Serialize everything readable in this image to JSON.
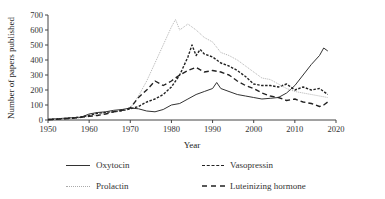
{
  "chart_data": {
    "type": "line",
    "title": "",
    "xlabel": "Year",
    "ylabel": "Number of papers published",
    "xlim": [
      1950,
      2020
    ],
    "ylim": [
      0,
      700
    ],
    "x_ticks": [
      1950,
      1960,
      1970,
      1980,
      1990,
      2000,
      2010,
      2020
    ],
    "y_ticks": [
      0,
      100,
      200,
      300,
      400,
      500,
      600,
      700
    ],
    "grid": false,
    "legend_position": "bottom",
    "series": [
      {
        "name": "Oxytocin",
        "style": "solid",
        "color": "#333333",
        "x": [
          1950,
          1952,
          1954,
          1956,
          1958,
          1960,
          1962,
          1964,
          1966,
          1968,
          1970,
          1972,
          1974,
          1976,
          1978,
          1980,
          1982,
          1984,
          1986,
          1988,
          1990,
          1991,
          1992,
          1994,
          1996,
          1998,
          2000,
          2002,
          2004,
          2006,
          2008,
          2010,
          2012,
          2014,
          2016,
          2017,
          2018
        ],
        "values": [
          5,
          8,
          12,
          15,
          18,
          40,
          50,
          55,
          65,
          70,
          80,
          75,
          60,
          55,
          70,
          100,
          110,
          140,
          170,
          190,
          210,
          250,
          210,
          190,
          170,
          160,
          150,
          140,
          145,
          150,
          180,
          230,
          300,
          370,
          430,
          480,
          460
        ]
      },
      {
        "name": "Vasopressin",
        "style": "dashed-fine",
        "color": "#222222",
        "x": [
          1950,
          1952,
          1954,
          1956,
          1958,
          1960,
          1962,
          1964,
          1966,
          1968,
          1970,
          1972,
          1974,
          1976,
          1978,
          1980,
          1982,
          1984,
          1985,
          1986,
          1987,
          1988,
          1990,
          1992,
          1994,
          1996,
          1998,
          2000,
          2002,
          2004,
          2006,
          2008,
          2010,
          2012,
          2014,
          2016,
          2018
        ],
        "values": [
          3,
          6,
          10,
          14,
          20,
          30,
          45,
          50,
          55,
          62,
          75,
          90,
          120,
          140,
          170,
          220,
          300,
          420,
          500,
          430,
          470,
          440,
          420,
          380,
          360,
          330,
          290,
          240,
          230,
          230,
          220,
          240,
          200,
          220,
          200,
          210,
          170
        ]
      },
      {
        "name": "Prolactin",
        "style": "dotted",
        "color": "#aaaaaa",
        "x": [
          1950,
          1952,
          1954,
          1956,
          1958,
          1960,
          1962,
          1964,
          1966,
          1968,
          1970,
          1972,
          1974,
          1976,
          1978,
          1980,
          1981,
          1982,
          1984,
          1986,
          1988,
          1990,
          1992,
          1994,
          1996,
          1998,
          2000,
          2002,
          2004,
          2006,
          2008,
          2010,
          2012,
          2014,
          2016,
          2018
        ],
        "values": [
          2,
          5,
          8,
          10,
          15,
          25,
          35,
          45,
          55,
          65,
          80,
          160,
          260,
          380,
          500,
          620,
          670,
          600,
          640,
          600,
          550,
          520,
          450,
          430,
          400,
          360,
          320,
          280,
          270,
          240,
          210,
          190,
          180,
          170,
          160,
          150
        ]
      },
      {
        "name": "Luteinizing hormone",
        "style": "dashed-long",
        "color": "#222222",
        "x": [
          1950,
          1952,
          1954,
          1956,
          1958,
          1960,
          1962,
          1964,
          1966,
          1968,
          1970,
          1972,
          1974,
          1976,
          1978,
          1980,
          1982,
          1984,
          1986,
          1988,
          1990,
          1992,
          1994,
          1996,
          1998,
          2000,
          2002,
          2004,
          2006,
          2008,
          2010,
          2012,
          2014,
          2016,
          2017,
          2018
        ],
        "values": [
          2,
          4,
          8,
          12,
          18,
          25,
          30,
          40,
          55,
          65,
          80,
          150,
          200,
          260,
          230,
          260,
          300,
          330,
          350,
          320,
          330,
          320,
          300,
          260,
          230,
          210,
          180,
          160,
          150,
          130,
          140,
          120,
          110,
          90,
          100,
          120
        ]
      }
    ]
  },
  "legend": {
    "items": [
      {
        "label": "Oxytocin"
      },
      {
        "label": "Vasopressin"
      },
      {
        "label": "Prolactin"
      },
      {
        "label": "Luteinizing hormone"
      }
    ]
  },
  "axes": {
    "xlabel": "Year",
    "ylabel": "Number of papers published",
    "x_tick_labels": [
      "1950",
      "1960",
      "1970",
      "1980",
      "1990",
      "2000",
      "2010",
      "2020"
    ],
    "y_tick_labels": [
      "0",
      "100",
      "200",
      "300",
      "400",
      "500",
      "600",
      "700"
    ]
  }
}
